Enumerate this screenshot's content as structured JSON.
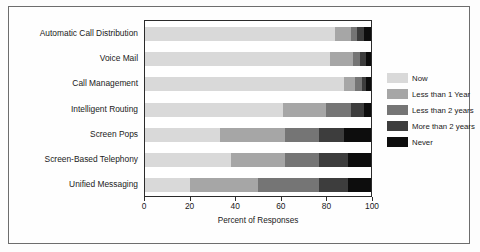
{
  "chart_data": {
    "type": "bar",
    "orientation": "horizontal",
    "stacked": true,
    "percent": true,
    "title": "",
    "xlabel": "Percent of Responses",
    "ylabel": "",
    "xlim": [
      0,
      100
    ],
    "xticks": [
      0,
      20,
      40,
      60,
      80,
      100
    ],
    "grid": false,
    "legend_position": "right",
    "categories": [
      "Automatic Call Distribution",
      "Voice Mail",
      "Call Management",
      "Intelligent Routing",
      "Screen Pops",
      "Screen-Based Telephony",
      "Unified Messaging"
    ],
    "series": [
      {
        "name": "Now",
        "color": "#d9d9d9",
        "values": [
          84,
          82,
          88,
          61,
          33,
          38,
          20
        ]
      },
      {
        "name": "Less than 1 Year",
        "color": "#a6a6a6",
        "values": [
          7,
          10,
          5,
          19,
          29,
          24,
          30
        ]
      },
      {
        "name": "Less than 2 years",
        "color": "#757575",
        "values": [
          3,
          3,
          3,
          11,
          15,
          15,
          27
        ]
      },
      {
        "name": "More than 2 years",
        "color": "#3d3d3d",
        "values": [
          3,
          3,
          2,
          6,
          11,
          13,
          13
        ]
      },
      {
        "name": "Never",
        "color": "#0d0d0d",
        "values": [
          3,
          2,
          2,
          3,
          12,
          10,
          10
        ]
      }
    ]
  },
  "legend": {
    "items": [
      {
        "label": "Now"
      },
      {
        "label": "Less than 1 Year"
      },
      {
        "label": "Less than 2 years"
      },
      {
        "label": "More than 2 years"
      },
      {
        "label": "Never"
      }
    ]
  }
}
